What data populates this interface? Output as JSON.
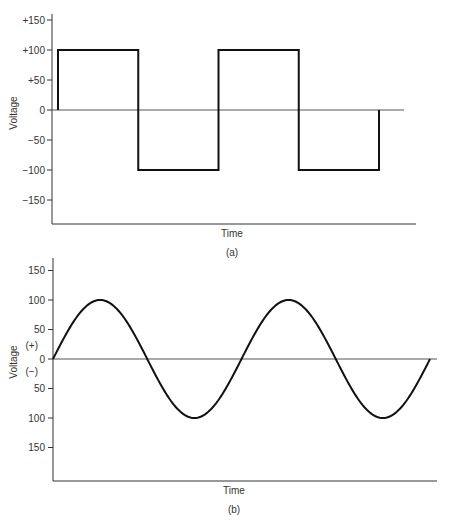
{
  "chart_data": [
    {
      "id": "a",
      "type": "line",
      "title": "",
      "caption": "(a)",
      "xlabel": "Time",
      "ylabel": "Voltage",
      "ylim": [
        -150,
        150
      ],
      "y_ticks": [
        150,
        100,
        50,
        0,
        -50,
        -100,
        -150
      ],
      "y_tick_labels": [
        "+150",
        "+100",
        "+50",
        "0",
        "−50",
        "−100",
        "−150"
      ],
      "waveform": "square",
      "amplitude": 100,
      "x_cycles": 2,
      "series": [
        {
          "name": "Square wave",
          "x": [
            0,
            0,
            1,
            1,
            2,
            2,
            3,
            3,
            4,
            4
          ],
          "y": [
            0,
            100,
            100,
            -100,
            -100,
            100,
            100,
            -100,
            -100,
            0
          ]
        }
      ],
      "grid": false,
      "legend": null
    },
    {
      "id": "b",
      "type": "line",
      "title": "",
      "caption": "(b)",
      "xlabel": "Time",
      "ylabel": "Voltage",
      "ylim": [
        -150,
        150
      ],
      "y_ticks": [
        150,
        100,
        50,
        0,
        -50,
        -100,
        -150
      ],
      "y_tick_labels": [
        "150",
        "100",
        "50",
        "0",
        "50",
        "100",
        "150"
      ],
      "polarity_labels": [
        "(+)",
        "(−)"
      ],
      "waveform": "sine",
      "amplitude": 100,
      "x_cycles": 2,
      "series": [
        {
          "name": "Sine wave",
          "x": [
            0,
            0.5,
            1,
            1.5,
            2,
            2.5,
            3,
            3.5,
            4
          ],
          "y": [
            0,
            100,
            0,
            -100,
            0,
            100,
            0,
            -100,
            0
          ]
        }
      ],
      "grid": false,
      "legend": null
    }
  ]
}
